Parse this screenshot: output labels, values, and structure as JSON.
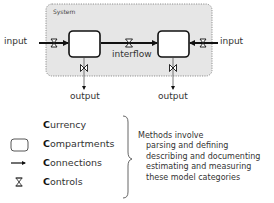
{
  "diagram": {
    "system_label": "System",
    "input_left": "input",
    "input_right": "input",
    "interflow": "interflow",
    "output_left": "output",
    "output_right": "output",
    "colors": {
      "system_fill": "#e6e6e6",
      "stroke": "#111111",
      "text": "#333333"
    }
  },
  "legend": {
    "items": [
      {
        "initial": "C",
        "rest": "urrency",
        "icon": "none"
      },
      {
        "initial": "C",
        "rest": "ompartments",
        "icon": "rounded-box-icon"
      },
      {
        "initial": "C",
        "rest": "onnections",
        "icon": "arrow-icon"
      },
      {
        "initial": "C",
        "rest": "ontrols",
        "icon": "valve-icon"
      }
    ]
  },
  "methods": {
    "heading": "Methods involve",
    "lines": [
      "parsing and defining",
      "describing and documenting",
      "estimating and measuring",
      "these model categories"
    ]
  }
}
